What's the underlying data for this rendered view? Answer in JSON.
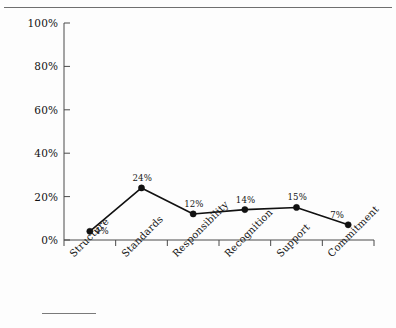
{
  "page": {
    "background_color": "#fdfdfd",
    "top_rule_color": "#6f6f6f",
    "footnote_rule_color": "#7a7a7a"
  },
  "chart_data": {
    "type": "line",
    "title": "",
    "subtitle": "",
    "xlabel": "",
    "ylabel": "",
    "categories": [
      "Structure",
      "Standards",
      "Responsibility",
      "Recognition",
      "Support",
      "Commitment"
    ],
    "values": [
      4,
      24,
      12,
      14,
      15,
      7
    ],
    "point_labels": [
      "4%",
      "24%",
      "12%",
      "14%",
      "15%",
      "7%"
    ],
    "ylim": [
      0,
      100
    ],
    "ytick_values": [
      0,
      20,
      40,
      60,
      80,
      100
    ],
    "ytick_labels": [
      "0%",
      "20%",
      "40%",
      "60%",
      "80%",
      "100%"
    ],
    "grid": false,
    "legend": false,
    "legend_position": "none",
    "line_color": "#111111",
    "marker_color": "#111111",
    "marker_shape": "circle",
    "axis_color": "#4a4a4a"
  }
}
